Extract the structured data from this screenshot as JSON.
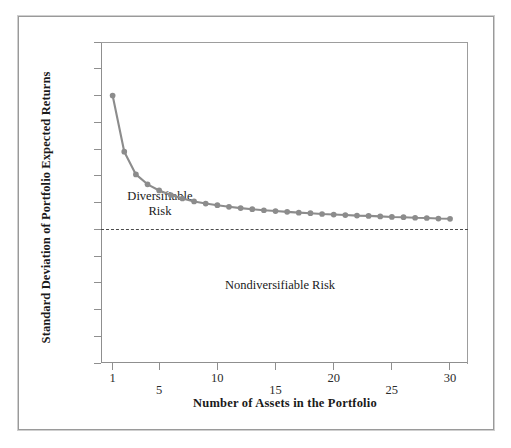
{
  "figure": {
    "background_color": "#ffffff",
    "frame_color": "#9a9a9a",
    "axis_color": "#8f8f8f",
    "series_color": "#8c8c8c",
    "threshold_color": "#4a4a4a"
  },
  "chart_data": {
    "type": "line",
    "title": "",
    "xlabel": "Number of Assets in the Portfolio",
    "ylabel": "Standard Deviation of Portfolio Expected Returns",
    "xlim": [
      0,
      31.5
    ],
    "ylim": [
      0,
      12
    ],
    "grid": false,
    "legend": null,
    "xticks": [
      1,
      5,
      10,
      15,
      20,
      25,
      30
    ],
    "xtick_labels": [
      "1",
      "5",
      "10",
      "15",
      "20",
      "25",
      "30"
    ],
    "yticks": [
      0,
      1,
      2,
      3,
      4,
      5,
      6,
      7,
      8,
      9,
      10,
      11,
      12
    ],
    "ytick_labels": [
      "0%",
      "1%",
      "2%",
      "3%",
      "4%",
      ".5%",
      "6%",
      "7%",
      "8%",
      "9%",
      "10%",
      "11%",
      "12%"
    ],
    "x": [
      1,
      2,
      3,
      4,
      5,
      6,
      7,
      8,
      9,
      10,
      11,
      12,
      13,
      14,
      15,
      16,
      17,
      18,
      19,
      20,
      21,
      22,
      23,
      24,
      25,
      26,
      27,
      28,
      29,
      30
    ],
    "values": [
      10.0,
      7.9,
      7.05,
      6.68,
      6.45,
      6.28,
      6.15,
      6.04,
      5.96,
      5.9,
      5.84,
      5.79,
      5.75,
      5.71,
      5.68,
      5.65,
      5.62,
      5.6,
      5.57,
      5.55,
      5.53,
      5.51,
      5.5,
      5.48,
      5.46,
      5.45,
      5.43,
      5.42,
      5.4,
      5.39
    ],
    "series": [
      {
        "name": "Portfolio standard deviation",
        "marker": "circle",
        "color": "#8c8c8c",
        "values": [
          10.0,
          7.9,
          7.05,
          6.68,
          6.45,
          6.28,
          6.15,
          6.04,
          5.96,
          5.9,
          5.84,
          5.79,
          5.75,
          5.71,
          5.68,
          5.65,
          5.62,
          5.6,
          5.57,
          5.55,
          5.53,
          5.51,
          5.5,
          5.48,
          5.46,
          5.45,
          5.43,
          5.42,
          5.4,
          5.39
        ]
      }
    ],
    "threshold": {
      "value": 5.0,
      "style": "dashed",
      "color": "#4a4a4a"
    },
    "annotations": [
      {
        "id": "diversifiable",
        "line1": "Diversifiable",
        "line2": "Risk"
      },
      {
        "id": "nondiversifiable",
        "line1": "Nondiversifiable Risk",
        "line2": ""
      }
    ]
  }
}
